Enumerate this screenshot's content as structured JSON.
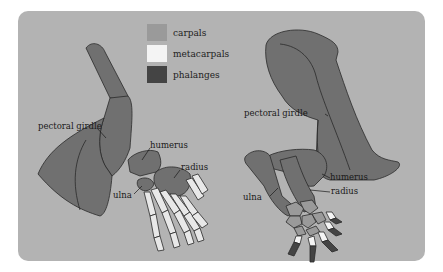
{
  "legend": {
    "items": [
      {
        "label": "carpals",
        "color": "#9a9a9a"
      },
      {
        "label": "metacarpals",
        "color": "#f4f4f4"
      },
      {
        "label": "phalanges",
        "color": "#444444"
      }
    ]
  },
  "left_figure": {
    "labels": {
      "pectoral_girdle": "pectoral girdle",
      "humerus": "humerus",
      "radius": "radius",
      "ulna": "ulna"
    }
  },
  "right_figure": {
    "labels": {
      "pectoral_girdle": "pectoral girdle",
      "humerus": "humerus",
      "radius": "radius",
      "ulna": "ulna"
    }
  },
  "colors": {
    "panel_bg": "#b3b3b3",
    "bone_fill": "#707070",
    "outline": "#2a2a2a"
  }
}
